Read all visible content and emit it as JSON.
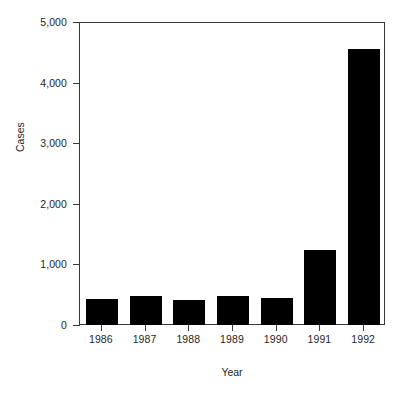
{
  "chart_data": {
    "type": "bar",
    "title": "",
    "subtitle": "",
    "xlabel": "Year",
    "ylabel": "Cases",
    "categories": [
      "1986",
      "1987",
      "1988",
      "1989",
      "1990",
      "1991",
      "1992"
    ],
    "values": [
      430,
      480,
      415,
      485,
      445,
      1240,
      4550
    ],
    "series": [
      {
        "name": "Cases",
        "values": [
          430,
          480,
          415,
          485,
          445,
          1240,
          4550
        ]
      }
    ],
    "ylim": [
      0,
      5000
    ],
    "yticks": [
      0,
      1000,
      2000,
      3000,
      4000,
      5000
    ],
    "ytick_labels": [
      "0",
      "1,000",
      "2,000",
      "3,000",
      "4,000",
      "5,000"
    ],
    "xtick_labels": [
      "1986",
      "1987",
      "1988",
      "1989",
      "1990",
      "1991",
      "1992"
    ],
    "grid": false,
    "legend": false,
    "legend_position": "none",
    "bar_color": "#000000",
    "axis_color": "#3a3a3a",
    "background_color": "#ffffff",
    "annotations": []
  }
}
